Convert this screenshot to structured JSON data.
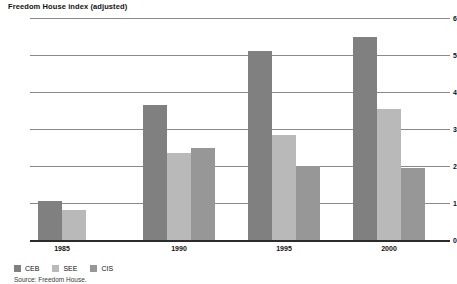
{
  "chart_data": {
    "type": "bar",
    "title": "Freedom House index (adjusted)",
    "xlabel": "",
    "ylabel": "",
    "ylim": [
      0,
      6
    ],
    "yticks": [
      0,
      1,
      2,
      3,
      4,
      5,
      6
    ],
    "grid": true,
    "legend_position": "bottom-left",
    "categories": [
      "1985",
      "1990",
      "1995",
      "2000"
    ],
    "series": [
      {
        "name": "CEB",
        "color": "#808080",
        "values": [
          1.05,
          3.65,
          5.1,
          5.5
        ]
      },
      {
        "name": "SEE",
        "color": "#b9b9b9",
        "values": [
          0.8,
          2.35,
          2.85,
          3.55
        ]
      },
      {
        "name": "CIS",
        "color": "#979797",
        "values": [
          null,
          2.5,
          2.0,
          1.95
        ]
      }
    ],
    "source": "Source: Freedom House."
  }
}
